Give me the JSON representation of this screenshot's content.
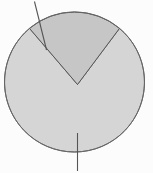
{
  "figure": {
    "title": "Circle divided into two sectors with callout lines",
    "canvas": {
      "width": 153,
      "height": 173,
      "background": "#fcfcfc"
    },
    "circle": {
      "label": "outer-circle",
      "center_x": 74.5,
      "center_y": 82.0,
      "radius": 70.0,
      "stroke": "#666666",
      "stroke_width": 1.0
    },
    "regions": [
      {
        "name": "major-sector",
        "label": "upper major sector",
        "fill": "#d5d5d5",
        "stroke": "#666666",
        "share_percent": 78,
        "sweep_degrees": 280
      },
      {
        "name": "wedge-sector",
        "label": "lower wedge sector",
        "fill": "#c6c6c6",
        "stroke": "#555555",
        "share_percent": 22,
        "sweep_degrees": 80,
        "apex_x": 77.5,
        "apex_y": 84.5,
        "start_angle_degrees": 230,
        "end_angle_degrees": 310
      }
    ],
    "callouts": [
      {
        "name": "callout-upper-left",
        "x1": 34.5,
        "y1": 1.5,
        "x2": 46.5,
        "y2": 50.0,
        "stroke": "#555555",
        "stroke_width": 1.1
      },
      {
        "name": "callout-bottom",
        "x1": 77.5,
        "y1": 133.0,
        "x2": 77.5,
        "y2": 171.0,
        "stroke": "#555555",
        "stroke_width": 1.1
      }
    ]
  },
  "chart_data": {
    "type": "pie",
    "title": "Circle divided into two sectors",
    "categories": [
      "major sector",
      "wedge sector"
    ],
    "values": [
      78,
      22
    ],
    "colors": [
      "#d5d5d5",
      "#c6c6c6"
    ],
    "xlabel": "",
    "ylabel": "",
    "legend": "none",
    "grid": false,
    "annotations": [
      "callout-upper-left",
      "callout-bottom"
    ]
  }
}
